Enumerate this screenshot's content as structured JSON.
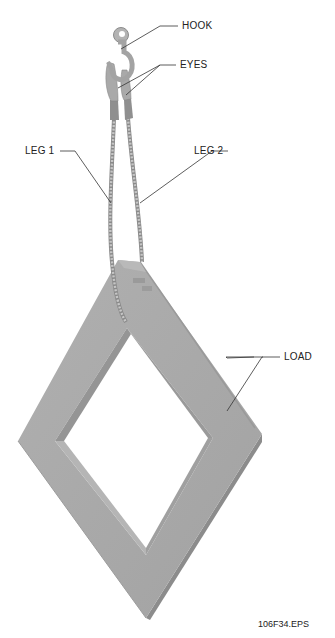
{
  "figure": {
    "id_label": "106F34.EPS"
  },
  "callouts": {
    "hook": "HOOK",
    "eyes": "EYES",
    "leg1": "LEG 1",
    "leg2": "LEG 2",
    "load": "LOAD"
  },
  "colors": {
    "load_face": "#a8a8a8",
    "load_dark": "#8f8f8f",
    "load_light": "#b8b8b8",
    "rigging": "#b0b0b0",
    "leader": "#333333"
  }
}
